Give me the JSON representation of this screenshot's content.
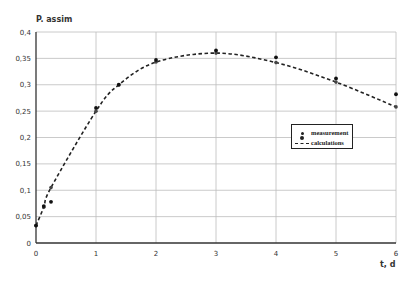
{
  "chart_data": {
    "type": "line",
    "title": "",
    "xlabel": "t, d",
    "ylabel": "P. assim",
    "xlim": [
      0,
      6
    ],
    "ylim": [
      0,
      0.4
    ],
    "x_ticks": [
      "0",
      "1",
      "2",
      "3",
      "4",
      "5",
      "6"
    ],
    "y_ticks": [
      "0",
      "0,05",
      "0,1",
      "0,15",
      "0,2",
      "0,25",
      "0,3",
      "0,35",
      "0,4"
    ],
    "grid": true,
    "legend_position": "center-right",
    "series": [
      {
        "name": "measurement",
        "style": "markers",
        "x": [
          0,
          0.13,
          0.25,
          1.0,
          1.38,
          2.0,
          3.0,
          4.0,
          5.0,
          6.0
        ],
        "y": [
          0.033,
          0.07,
          0.078,
          0.256,
          0.3,
          0.347,
          0.365,
          0.352,
          0.312,
          0.282
        ]
      },
      {
        "name": "calculations",
        "style": "dashed-line-markers",
        "x": [
          0,
          0.13,
          0.25,
          1.0,
          1.38,
          2.0,
          3.0,
          4.0,
          5.0,
          6.0
        ],
        "y": [
          0.033,
          0.068,
          0.105,
          0.25,
          0.3,
          0.343,
          0.36,
          0.342,
          0.305,
          0.258
        ]
      }
    ]
  },
  "legend": {
    "items": [
      {
        "label": "measurement"
      },
      {
        "label": "calculations"
      }
    ]
  }
}
